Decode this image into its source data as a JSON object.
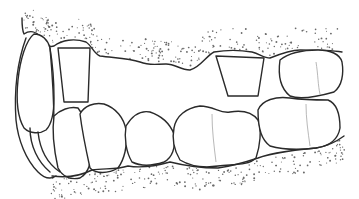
{
  "figure": {
    "colors": {
      "background": "#ffffff",
      "outline": "#2a2a2a",
      "stipple": "#6a6a6a"
    },
    "elements": {
      "upper_gingiva": "stippled gum line along top",
      "lower_gingiva": "stippled gum line along bottom",
      "incisors": "front teeth at left edge",
      "upper_abutment_left": "prepared tooth stump near left",
      "upper_abutment_right": "prepared tooth stump center-right",
      "upper_molar": "molar at upper right",
      "lower_teeth": "row of lower premolars and molars"
    }
  }
}
